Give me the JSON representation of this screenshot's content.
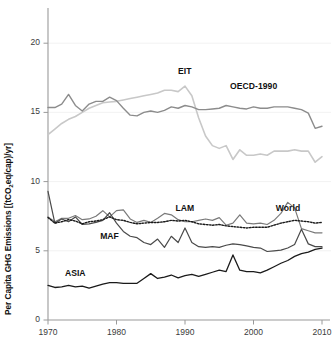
{
  "chart_data": {
    "type": "line",
    "title": "",
    "xlabel": "",
    "ylabel": "Per Capita GHG Emissions [(tCO2eq/cap)/yr]",
    "ylabel_parts": {
      "pre": "Per Capita GHG Emissions [(tCO",
      "sub": "2",
      "post": "eq/cap)/yr]"
    },
    "xlim": [
      1970,
      2010
    ],
    "ylim": [
      0,
      22
    ],
    "grid": false,
    "legend_position": "inline-annotations",
    "x_ticks": [
      "1970",
      "1980",
      "1990",
      "2000",
      "2010"
    ],
    "x_tick_values": [
      1970,
      1980,
      1990,
      2000,
      2010
    ],
    "y_ticks": [
      "0",
      "5",
      "10",
      "15",
      "20"
    ],
    "y_tick_values": [
      0,
      5,
      10,
      15,
      20
    ],
    "x": [
      1970,
      1971,
      1972,
      1973,
      1974,
      1975,
      1976,
      1977,
      1978,
      1979,
      1980,
      1981,
      1982,
      1983,
      1984,
      1985,
      1986,
      1987,
      1988,
      1989,
      1990,
      1991,
      1992,
      1993,
      1994,
      1995,
      1996,
      1997,
      1998,
      1999,
      2000,
      2001,
      2002,
      2003,
      2004,
      2005,
      2006,
      2007,
      2008,
      2009,
      2010
    ],
    "series": [
      {
        "name": "EIT",
        "label": "EIT",
        "color": "#c8c8c8",
        "style": "solid",
        "width": 1.6,
        "label_x": 1990,
        "label_y": 17.9,
        "values": [
          13.4,
          13.8,
          14.2,
          14.5,
          14.7,
          15.0,
          15.3,
          15.5,
          15.7,
          15.75,
          15.8,
          15.9,
          16.0,
          16.1,
          16.2,
          16.3,
          16.4,
          16.6,
          16.6,
          16.5,
          16.9,
          16.2,
          14.6,
          13.3,
          12.6,
          12.4,
          12.6,
          11.6,
          12.3,
          11.9,
          11.9,
          12.0,
          11.9,
          12.2,
          12.2,
          12.2,
          12.3,
          12.2,
          12.2,
          11.4,
          11.8
        ]
      },
      {
        "name": "OECD-1990",
        "label": "OECD-1990",
        "color": "#8c8c8c",
        "style": "solid",
        "width": 1.4,
        "label_x": 2000,
        "label_y": 16.8,
        "values": [
          15.35,
          15.35,
          15.6,
          16.3,
          15.5,
          15.1,
          15.6,
          15.8,
          15.8,
          16.1,
          15.85,
          15.3,
          14.8,
          14.75,
          15.0,
          15.1,
          15.0,
          15.15,
          15.4,
          15.3,
          15.5,
          15.4,
          15.2,
          15.2,
          15.25,
          15.3,
          15.5,
          15.4,
          15.3,
          15.25,
          15.4,
          15.3,
          15.3,
          15.4,
          15.4,
          15.4,
          15.3,
          15.2,
          14.95,
          13.85,
          14.0
        ]
      },
      {
        "name": "LAM",
        "label": "LAM",
        "color": "#7a7a7a",
        "style": "solid",
        "width": 1.2,
        "label_x": 1990,
        "label_y": 8.05,
        "values": [
          7.45,
          7.1,
          7.35,
          7.35,
          7.55,
          7.25,
          7.3,
          7.5,
          7.9,
          7.45,
          7.9,
          7.95,
          7.3,
          7.05,
          7.2,
          7.05,
          7.35,
          7.7,
          7.6,
          7.25,
          7.1,
          7.1,
          7.2,
          7.3,
          7.2,
          7.4,
          6.85,
          7.0,
          7.6,
          7.0,
          6.95,
          7.0,
          6.9,
          7.2,
          7.7,
          8.5,
          8.1,
          6.6,
          6.45,
          6.3,
          6.3
        ]
      },
      {
        "name": "MAF",
        "label": "MAF",
        "color": "#4a4a4a",
        "style": "solid",
        "width": 1.2,
        "label_x": 1979,
        "label_y": 6.0,
        "values": [
          9.3,
          7.0,
          7.3,
          7.1,
          7.45,
          6.9,
          6.95,
          7.05,
          7.2,
          7.75,
          7.0,
          6.4,
          6.05,
          5.95,
          5.6,
          5.45,
          5.85,
          5.25,
          6.05,
          5.6,
          6.65,
          5.6,
          5.3,
          5.25,
          5.3,
          5.25,
          5.4,
          5.5,
          5.45,
          5.35,
          5.25,
          5.2,
          4.95,
          5.0,
          5.05,
          5.2,
          5.45,
          6.55,
          5.5,
          5.3,
          5.3
        ]
      },
      {
        "name": "ASIA",
        "label": "ASIA",
        "color": "#1a1a1a",
        "style": "solid",
        "width": 1.3,
        "label_x": 1974,
        "label_y": 3.35,
        "values": [
          2.5,
          2.35,
          2.4,
          2.5,
          2.4,
          2.45,
          2.3,
          2.45,
          2.6,
          2.7,
          2.7,
          2.65,
          2.65,
          2.65,
          3.0,
          3.35,
          3.0,
          3.1,
          3.25,
          3.05,
          3.2,
          3.3,
          3.15,
          3.3,
          3.45,
          3.6,
          3.5,
          4.7,
          3.6,
          3.5,
          3.5,
          3.4,
          3.6,
          3.85,
          4.1,
          4.3,
          4.6,
          4.8,
          4.9,
          5.1,
          5.2
        ]
      },
      {
        "name": "World",
        "label": "World",
        "color": "#1a1a1a",
        "style": "dotted",
        "width": 1.4,
        "label_x": 2005,
        "label_y": 8.0,
        "values": [
          7.4,
          7.0,
          7.1,
          7.25,
          7.15,
          6.95,
          7.1,
          7.15,
          7.25,
          7.45,
          7.25,
          7.2,
          7.05,
          6.95,
          7.0,
          7.05,
          7.05,
          7.1,
          7.2,
          7.15,
          7.2,
          7.1,
          6.95,
          6.9,
          6.85,
          6.9,
          6.8,
          6.75,
          6.7,
          6.65,
          6.7,
          6.7,
          6.7,
          6.85,
          7.0,
          7.1,
          7.2,
          7.15,
          7.1,
          7.0,
          7.05
        ]
      }
    ]
  },
  "axes": {
    "y_tick_labels": [
      "20",
      "15",
      "10",
      "5",
      "0"
    ],
    "x_tick_labels": [
      "1970",
      "1980",
      "1990",
      "2000",
      "2010"
    ]
  }
}
